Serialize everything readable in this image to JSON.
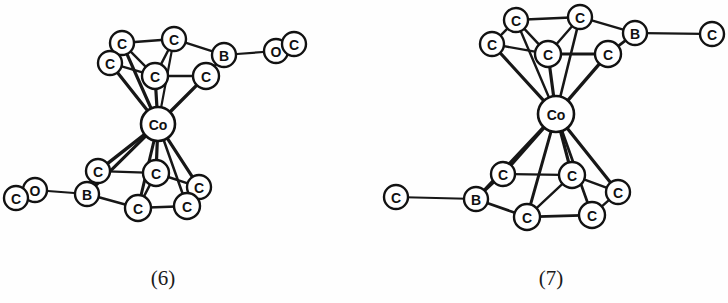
{
  "figure": {
    "background_color": "#fefefe",
    "line_color": "#171717",
    "node_fill": "#ffffff",
    "node_stroke": "#121212",
    "width": 728,
    "height": 303
  },
  "structures": [
    {
      "id": "structure-6",
      "caption": "(6)",
      "caption_x": 163,
      "caption_y": 278,
      "atoms": [
        {
          "key": "u_c_topleft",
          "label": "C",
          "x": 122,
          "y": 43,
          "r": 12,
          "font": 14,
          "kind": "carbon"
        },
        {
          "key": "u_c_topmid",
          "label": "C",
          "x": 174,
          "y": 39,
          "r": 12,
          "font": 14,
          "kind": "carbon"
        },
        {
          "key": "u_c_left",
          "label": "C",
          "x": 110,
          "y": 63,
          "r": 12,
          "font": 14,
          "kind": "carbon"
        },
        {
          "key": "u_c_center",
          "label": "C",
          "x": 155,
          "y": 76,
          "r": 13,
          "font": 14,
          "kind": "carbon"
        },
        {
          "key": "u_c_right",
          "label": "C",
          "x": 206,
          "y": 76,
          "r": 13,
          "font": 14,
          "kind": "carbon"
        },
        {
          "key": "u_b",
          "label": "B",
          "x": 224,
          "y": 55,
          "r": 12,
          "font": 14,
          "kind": "boron"
        },
        {
          "key": "u_o",
          "label": "O",
          "x": 276,
          "y": 51,
          "r": 12,
          "font": 14,
          "kind": "oxygen"
        },
        {
          "key": "u_c_term",
          "label": "C",
          "x": 294,
          "y": 44,
          "r": 12,
          "font": 14,
          "kind": "carbon"
        },
        {
          "key": "co",
          "label": "Co",
          "x": 158,
          "y": 124,
          "r": 17,
          "font": 14,
          "kind": "cobalt"
        },
        {
          "key": "l_c_left",
          "label": "C",
          "x": 98,
          "y": 171,
          "r": 12,
          "font": 14,
          "kind": "carbon"
        },
        {
          "key": "l_c_center",
          "label": "C",
          "x": 156,
          "y": 173,
          "r": 13,
          "font": 14,
          "kind": "carbon"
        },
        {
          "key": "l_c_right",
          "label": "C",
          "x": 199,
          "y": 187,
          "r": 12,
          "font": 14,
          "kind": "carbon"
        },
        {
          "key": "l_b",
          "label": "B",
          "x": 87,
          "y": 194,
          "r": 12,
          "font": 14,
          "kind": "boron"
        },
        {
          "key": "l_c_bot",
          "label": "C",
          "x": 138,
          "y": 208,
          "r": 13,
          "font": 14,
          "kind": "carbon"
        },
        {
          "key": "l_c_botright",
          "label": "C",
          "x": 187,
          "y": 206,
          "r": 13,
          "font": 14,
          "kind": "carbon"
        },
        {
          "key": "l_o",
          "label": "O",
          "x": 35,
          "y": 190,
          "r": 12,
          "font": 14,
          "kind": "oxygen"
        },
        {
          "key": "l_c_term",
          "label": "C",
          "x": 16,
          "y": 198,
          "r": 12,
          "font": 14,
          "kind": "carbon"
        }
      ],
      "bonds": [
        {
          "from": "u_c_topleft",
          "to": "u_c_topmid",
          "w": 2.4
        },
        {
          "from": "u_c_topleft",
          "to": "u_c_left",
          "w": 2.4
        },
        {
          "from": "u_c_topleft",
          "to": "u_c_center",
          "w": 2.4
        },
        {
          "from": "u_c_topmid",
          "to": "u_c_center",
          "w": 2.4
        },
        {
          "from": "u_c_topmid",
          "to": "u_b",
          "w": 2.4
        },
        {
          "from": "u_c_left",
          "to": "u_c_center",
          "w": 2.4
        },
        {
          "from": "u_c_center",
          "to": "u_c_right",
          "w": 2.6
        },
        {
          "from": "u_c_right",
          "to": "u_b",
          "w": 2.4
        },
        {
          "from": "u_b",
          "to": "u_o",
          "w": 2.2
        },
        {
          "from": "u_c_left",
          "to": "co",
          "w": 3.2
        },
        {
          "from": "u_c_topleft",
          "to": "co",
          "w": 3.2
        },
        {
          "from": "u_c_center",
          "to": "co",
          "w": 3.2
        },
        {
          "from": "u_c_right",
          "to": "co",
          "w": 3.4
        },
        {
          "from": "u_c_topmid",
          "to": "co",
          "w": 2.2
        },
        {
          "from": "co",
          "to": "l_c_left",
          "w": 3.4
        },
        {
          "from": "co",
          "to": "l_b",
          "w": 3.2
        },
        {
          "from": "co",
          "to": "l_c_center",
          "w": 3.2
        },
        {
          "from": "co",
          "to": "l_c_bot",
          "w": 3.0
        },
        {
          "from": "co",
          "to": "l_c_right",
          "w": 3.2
        },
        {
          "from": "co",
          "to": "l_c_botright",
          "w": 2.6
        },
        {
          "from": "l_b",
          "to": "l_c_left",
          "w": 2.4
        },
        {
          "from": "l_b",
          "to": "l_c_bot",
          "w": 2.4
        },
        {
          "from": "l_c_left",
          "to": "l_c_center",
          "w": 2.4
        },
        {
          "from": "l_c_center",
          "to": "l_c_bot",
          "w": 2.4
        },
        {
          "from": "l_c_center",
          "to": "l_c_right",
          "w": 2.4
        },
        {
          "from": "l_c_bot",
          "to": "l_c_botright",
          "w": 2.6
        },
        {
          "from": "l_c_botright",
          "to": "l_c_right",
          "w": 2.4
        },
        {
          "from": "l_b",
          "to": "l_o",
          "w": 2.2
        }
      ]
    },
    {
      "id": "structure-7",
      "caption": "(7)",
      "caption_x": 551,
      "caption_y": 278,
      "atoms": [
        {
          "key": "u_c_topleft",
          "label": "C",
          "x": 516,
          "y": 20,
          "r": 12,
          "font": 14,
          "kind": "carbon"
        },
        {
          "key": "u_c_topmid",
          "label": "C",
          "x": 580,
          "y": 17,
          "r": 12,
          "font": 14,
          "kind": "carbon"
        },
        {
          "key": "u_c_left",
          "label": "C",
          "x": 492,
          "y": 44,
          "r": 12,
          "font": 14,
          "kind": "carbon"
        },
        {
          "key": "u_c_center",
          "label": "C",
          "x": 548,
          "y": 54,
          "r": 13,
          "font": 14,
          "kind": "carbon"
        },
        {
          "key": "u_c_right",
          "label": "C",
          "x": 608,
          "y": 54,
          "r": 13,
          "font": 14,
          "kind": "carbon"
        },
        {
          "key": "u_b",
          "label": "B",
          "x": 635,
          "y": 33,
          "r": 12,
          "font": 14,
          "kind": "boron"
        },
        {
          "key": "u_c_term",
          "label": "C",
          "x": 712,
          "y": 34,
          "r": 12,
          "font": 14,
          "kind": "carbon"
        },
        {
          "key": "co",
          "label": "Co",
          "x": 556,
          "y": 114,
          "r": 18,
          "font": 14,
          "kind": "cobalt"
        },
        {
          "key": "l_c_left",
          "label": "C",
          "x": 503,
          "y": 174,
          "r": 12,
          "font": 14,
          "kind": "carbon"
        },
        {
          "key": "l_c_center",
          "label": "C",
          "x": 572,
          "y": 175,
          "r": 13,
          "font": 14,
          "kind": "carbon"
        },
        {
          "key": "l_c_right",
          "label": "C",
          "x": 618,
          "y": 192,
          "r": 12,
          "font": 14,
          "kind": "carbon"
        },
        {
          "key": "l_b",
          "label": "B",
          "x": 476,
          "y": 199,
          "r": 12,
          "font": 14,
          "kind": "boron"
        },
        {
          "key": "l_c_bot",
          "label": "C",
          "x": 527,
          "y": 217,
          "r": 13,
          "font": 14,
          "kind": "carbon"
        },
        {
          "key": "l_c_botright",
          "label": "C",
          "x": 592,
          "y": 215,
          "r": 13,
          "font": 14,
          "kind": "carbon"
        },
        {
          "key": "l_c_term",
          "label": "C",
          "x": 396,
          "y": 197,
          "r": 12,
          "font": 14,
          "kind": "carbon"
        }
      ],
      "bonds": [
        {
          "from": "u_c_topleft",
          "to": "u_c_topmid",
          "w": 2.6
        },
        {
          "from": "u_c_topleft",
          "to": "u_c_left",
          "w": 2.4
        },
        {
          "from": "u_c_topleft",
          "to": "u_c_center",
          "w": 2.4
        },
        {
          "from": "u_c_topmid",
          "to": "u_c_center",
          "w": 2.4
        },
        {
          "from": "u_c_topmid",
          "to": "u_b",
          "w": 2.4
        },
        {
          "from": "u_c_left",
          "to": "u_c_center",
          "w": 2.4
        },
        {
          "from": "u_c_center",
          "to": "u_c_right",
          "w": 2.8
        },
        {
          "from": "u_c_right",
          "to": "u_b",
          "w": 2.8
        },
        {
          "from": "u_b",
          "to": "u_c_term",
          "w": 2.2
        },
        {
          "from": "u_c_left",
          "to": "co",
          "w": 3.2
        },
        {
          "from": "u_c_topleft",
          "to": "co",
          "w": 2.4
        },
        {
          "from": "u_c_center",
          "to": "co",
          "w": 3.2
        },
        {
          "from": "u_c_right",
          "to": "co",
          "w": 3.4
        },
        {
          "from": "u_c_topmid",
          "to": "co",
          "w": 2.6
        },
        {
          "from": "co",
          "to": "l_c_left",
          "w": 3.4
        },
        {
          "from": "co",
          "to": "l_b",
          "w": 3.2
        },
        {
          "from": "co",
          "to": "l_c_center",
          "w": 3.2
        },
        {
          "from": "co",
          "to": "l_c_bot",
          "w": 3.0
        },
        {
          "from": "co",
          "to": "l_c_right",
          "w": 3.2
        },
        {
          "from": "co",
          "to": "l_c_botright",
          "w": 2.8
        },
        {
          "from": "l_b",
          "to": "l_c_left",
          "w": 2.4
        },
        {
          "from": "l_b",
          "to": "l_c_bot",
          "w": 2.6
        },
        {
          "from": "l_c_left",
          "to": "l_c_center",
          "w": 2.4
        },
        {
          "from": "l_c_center",
          "to": "l_c_bot",
          "w": 2.4
        },
        {
          "from": "l_c_center",
          "to": "l_c_right",
          "w": 2.4
        },
        {
          "from": "l_c_bot",
          "to": "l_c_botright",
          "w": 2.8
        },
        {
          "from": "l_c_botright",
          "to": "l_c_right",
          "w": 2.4
        },
        {
          "from": "l_b",
          "to": "l_c_term",
          "w": 2.2
        }
      ]
    }
  ]
}
